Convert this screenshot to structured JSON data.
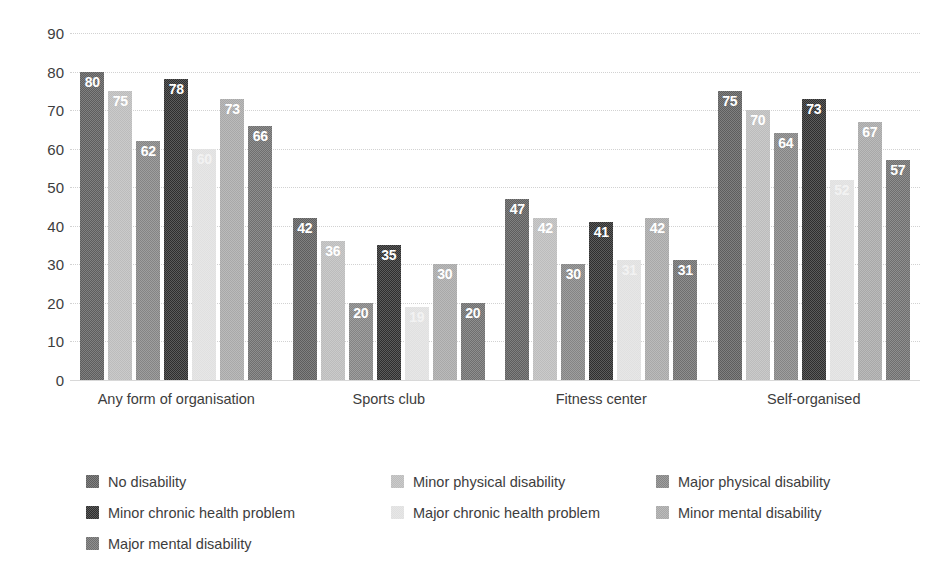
{
  "chart_data": {
    "type": "bar",
    "title": "",
    "subtitle": "",
    "xlabel": "",
    "ylabel": "",
    "ylim": [
      0,
      90
    ],
    "ytick_step": 10,
    "yticks": [
      0,
      10,
      20,
      30,
      40,
      50,
      60,
      70,
      80,
      90
    ],
    "grid": true,
    "legend_position": "bottom",
    "categories": [
      "Any form of organisation",
      "Sports club",
      "Fitness center",
      "Self-organised"
    ],
    "series": [
      {
        "name": "No disability",
        "color": "#5e5e5e",
        "values": [
          80,
          42,
          47,
          75
        ]
      },
      {
        "name": "Minor physical disability",
        "color": "#bcbcbc",
        "values": [
          75,
          36,
          42,
          70
        ]
      },
      {
        "name": "Major physical disability",
        "color": "#848484",
        "values": [
          62,
          20,
          30,
          64
        ]
      },
      {
        "name": "Minor chronic health problem",
        "color": "#2e2e2e",
        "values": [
          78,
          35,
          41,
          73
        ]
      },
      {
        "name": "Major chronic health problem",
        "color": "#e0e0e0",
        "values": [
          60,
          19,
          31,
          52
        ]
      },
      {
        "name": "Minor mental disability",
        "color": "#a8a8a8",
        "values": [
          73,
          30,
          42,
          67
        ]
      },
      {
        "name": "Major mental disability",
        "color": "#6f6f6f",
        "values": [
          66,
          20,
          31,
          57
        ]
      }
    ]
  },
  "legend": {
    "items": [
      "No disability",
      "Minor physical disability",
      "Major physical disability",
      "Minor chronic health problem",
      "Major chronic health problem",
      "Minor mental disability",
      "Major mental disability"
    ]
  }
}
